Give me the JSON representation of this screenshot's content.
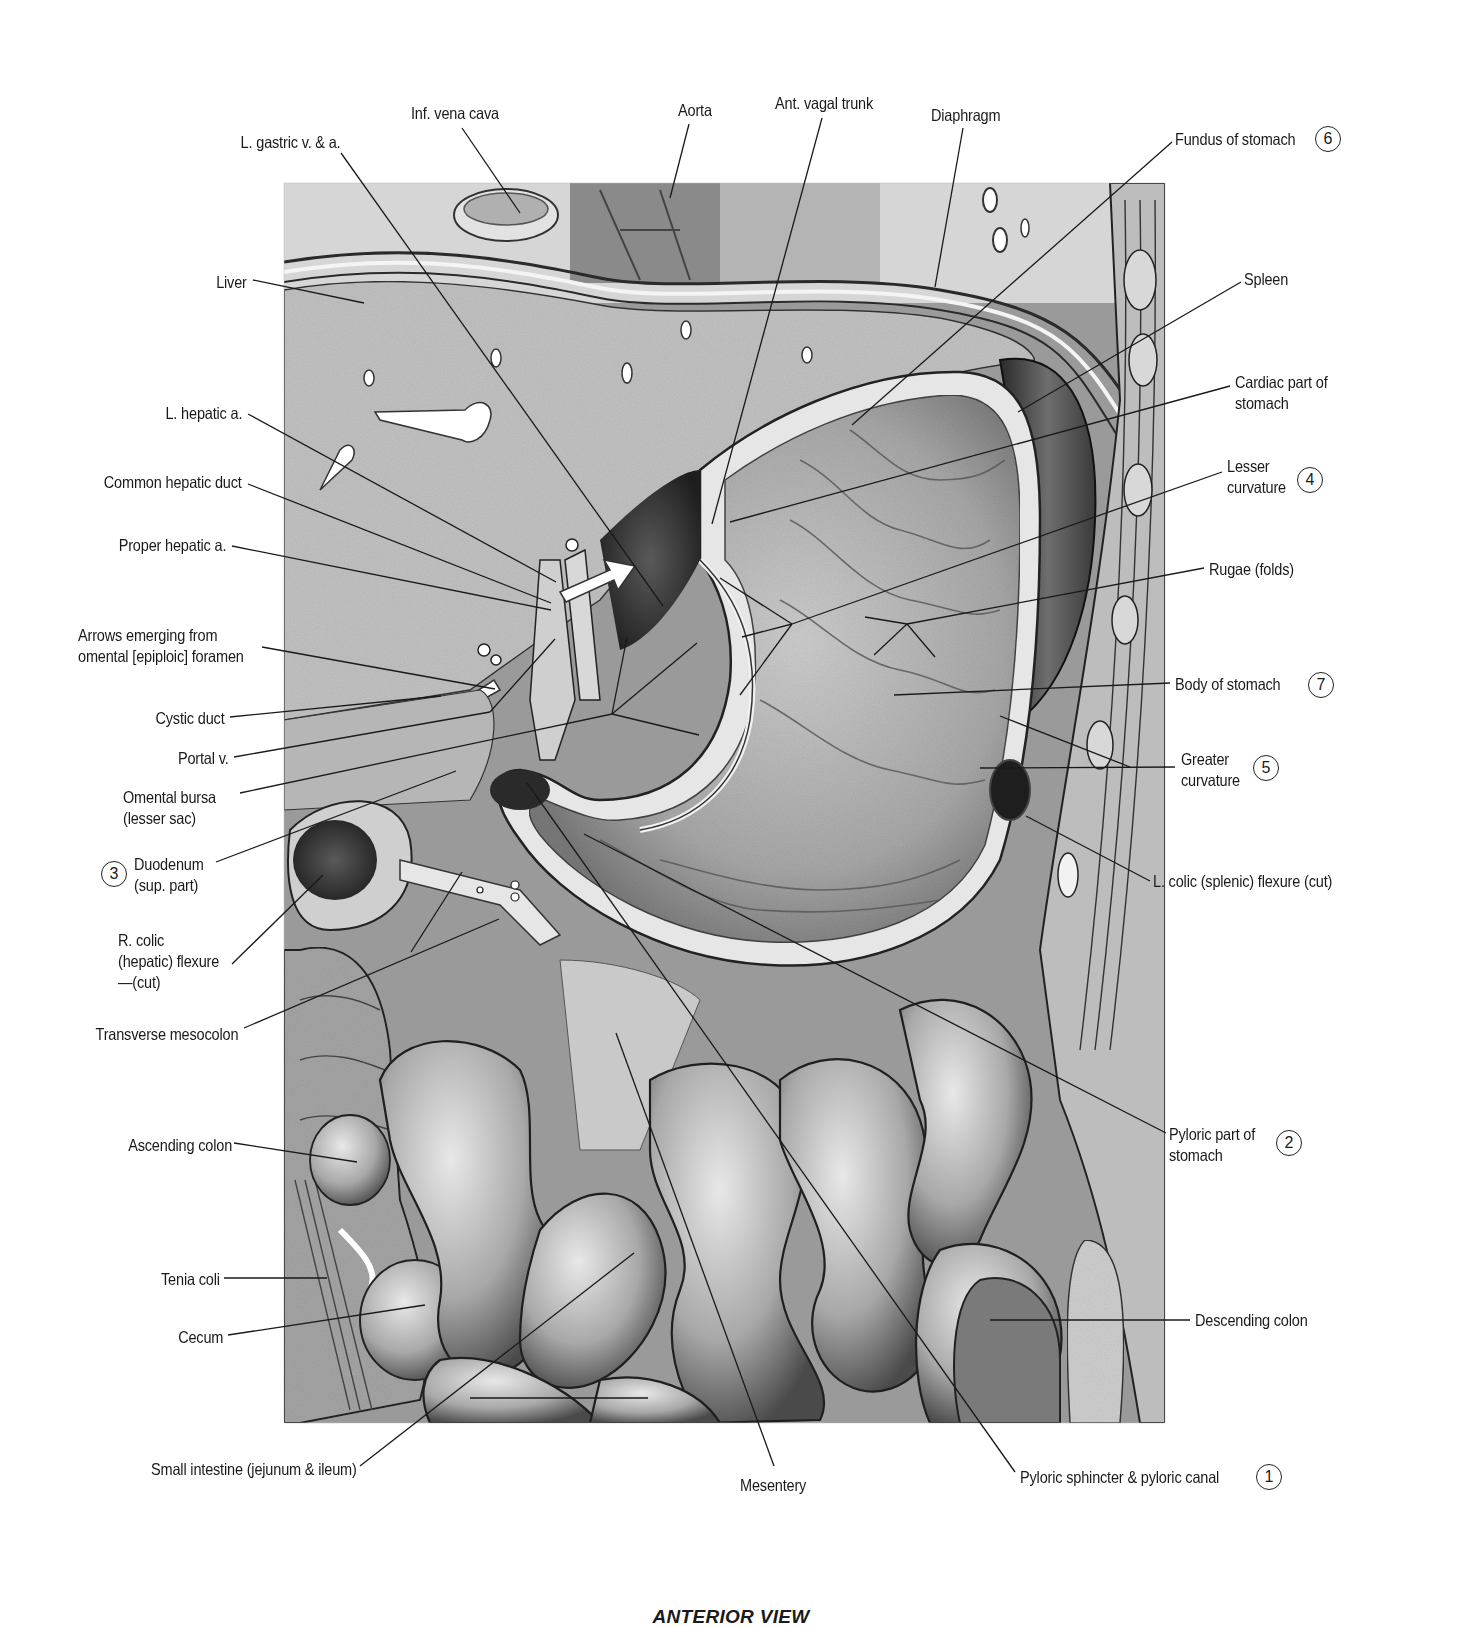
{
  "figure": {
    "caption": "ANTERIOR VIEW",
    "colors": {
      "ink": "#1a1a1a",
      "tissue_light": "#d4d4d4",
      "tissue_mid": "#a8a8a8",
      "tissue_dark": "#3c3c3c",
      "background": "#ffffff"
    }
  },
  "labels": [
    {
      "id": "inf-vena-cava",
      "text": "Inf. vena cava",
      "x": 411,
      "y": 103,
      "align": "l"
    },
    {
      "id": "l-gastric",
      "text": "L. gastric v. & a.",
      "x": 340,
      "y": 132,
      "align": "r"
    },
    {
      "id": "aorta",
      "text": "Aorta",
      "x": 678,
      "y": 100,
      "align": "l"
    },
    {
      "id": "ant-vagal-trunk",
      "text": "Ant. vagal trunk",
      "x": 775,
      "y": 93,
      "align": "l"
    },
    {
      "id": "diaphragm",
      "text": "Diaphragm",
      "x": 931,
      "y": 105,
      "align": "l"
    },
    {
      "id": "fundus",
      "text": "Fundus of stomach",
      "x": 1175,
      "y": 129,
      "align": "l",
      "number": "6"
    },
    {
      "id": "liver",
      "text": "Liver",
      "x": 247,
      "y": 272,
      "align": "r"
    },
    {
      "id": "spleen",
      "text": "Spleen",
      "x": 1244,
      "y": 269,
      "align": "l"
    },
    {
      "id": "cardiac-part",
      "text": "Cardiac part of",
      "text2": "stomach",
      "x": 1235,
      "y": 372,
      "align": "l"
    },
    {
      "id": "l-hepatic-a",
      "text": "L. hepatic a.",
      "x": 242,
      "y": 403,
      "align": "r"
    },
    {
      "id": "lesser-curvature",
      "text": "Lesser",
      "text2": "curvature",
      "x": 1227,
      "y": 456,
      "align": "l",
      "number": "4"
    },
    {
      "id": "common-hepatic-duct",
      "text": "Common hepatic duct",
      "x": 242,
      "y": 472,
      "align": "r"
    },
    {
      "id": "proper-hepatic-a",
      "text": "Proper hepatic a.",
      "x": 226,
      "y": 535,
      "align": "r"
    },
    {
      "id": "rugae",
      "text": "Rugae (folds)",
      "x": 1209,
      "y": 559,
      "align": "l"
    },
    {
      "id": "arrows-omental",
      "text": "Arrows emerging from",
      "text2": "omental [epiploic] foramen",
      "x": 78,
      "y": 625,
      "align": "l"
    },
    {
      "id": "body-of-stomach",
      "text": "Body of stomach",
      "x": 1175,
      "y": 674,
      "align": "l",
      "number": "7"
    },
    {
      "id": "cystic-duct",
      "text": "Cystic duct",
      "x": 224,
      "y": 708,
      "align": "r"
    },
    {
      "id": "portal-v",
      "text": "Portal v.",
      "x": 228,
      "y": 748,
      "align": "r"
    },
    {
      "id": "greater-curvature",
      "text": "Greater",
      "text2": "curvature",
      "x": 1181,
      "y": 749,
      "align": "l",
      "number": "5"
    },
    {
      "id": "omental-bursa",
      "text": "Omental bursa",
      "text2": "(lesser sac)",
      "x": 123,
      "y": 787,
      "align": "l"
    },
    {
      "id": "duodenum",
      "text": "Duodenum",
      "text2": "(sup. part)",
      "x": 134,
      "y": 854,
      "align": "l",
      "number": "3",
      "number_side": "left"
    },
    {
      "id": "l-colic-flexure",
      "text": "L. colic (splenic) flexure (cut)",
      "x": 1153,
      "y": 871,
      "align": "l"
    },
    {
      "id": "r-colic-flexure",
      "text": "R. colic",
      "text2": "(hepatic) flexure",
      "text3": "—(cut)",
      "x": 118,
      "y": 930,
      "align": "l"
    },
    {
      "id": "transverse-mesocolon",
      "text": "Transverse mesocolon",
      "x": 238,
      "y": 1024,
      "align": "r"
    },
    {
      "id": "ascending-colon",
      "text": "Ascending colon",
      "x": 232,
      "y": 1135,
      "align": "r"
    },
    {
      "id": "pyloric-part",
      "text": "Pyloric part of",
      "text2": "stomach",
      "x": 1169,
      "y": 1124,
      "align": "l",
      "number": "2"
    },
    {
      "id": "tenia-coli",
      "text": "Tenia coli",
      "x": 220,
      "y": 1269,
      "align": "r"
    },
    {
      "id": "cecum",
      "text": "Cecum",
      "x": 223,
      "y": 1327,
      "align": "r"
    },
    {
      "id": "descending-colon",
      "text": "Descending colon",
      "x": 1195,
      "y": 1310,
      "align": "l"
    },
    {
      "id": "small-intestine",
      "text": "Small intestine (jejunum & ileum)",
      "x": 357,
      "y": 1459,
      "align": "r"
    },
    {
      "id": "mesentery",
      "text": "Mesentery",
      "x": 740,
      "y": 1475,
      "align": "l"
    },
    {
      "id": "pyloric-sphincter",
      "text": "Pyloric sphincter & pyloric canal",
      "x": 1020,
      "y": 1467,
      "align": "l",
      "number": "1"
    }
  ]
}
